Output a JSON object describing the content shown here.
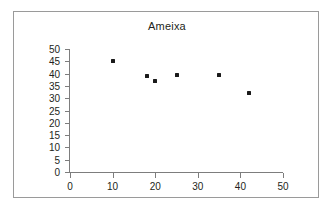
{
  "figure": {
    "background_color": "#ffffff",
    "frame_border_color": "#9a9a9a"
  },
  "chart_data": {
    "type": "scatter",
    "title": "Ameixa",
    "subtitle": "",
    "xlabel": "",
    "ylabel": "",
    "xlim": [
      0,
      50
    ],
    "ylim": [
      0,
      50
    ],
    "xticks": [
      0,
      10,
      20,
      30,
      40,
      50
    ],
    "yticks": [
      0,
      5,
      10,
      15,
      20,
      25,
      30,
      35,
      40,
      45,
      50
    ],
    "xtick_labels": [
      "0",
      "10",
      "20",
      "30",
      "40",
      "50"
    ],
    "ytick_labels": [
      "0",
      "5",
      "10",
      "15",
      "20",
      "25",
      "30",
      "35",
      "40",
      "45",
      "50"
    ],
    "grid": false,
    "legend": false,
    "legend_position": "none",
    "marker": "diamond",
    "marker_color": "#1a1a1a",
    "axis_color": "#7d7d7d",
    "points": [
      {
        "x": 10,
        "y": 45
      },
      {
        "x": 18,
        "y": 39
      },
      {
        "x": 20,
        "y": 37
      },
      {
        "x": 25,
        "y": 39.5
      },
      {
        "x": 35,
        "y": 39.5
      },
      {
        "x": 42,
        "y": 32
      }
    ]
  }
}
